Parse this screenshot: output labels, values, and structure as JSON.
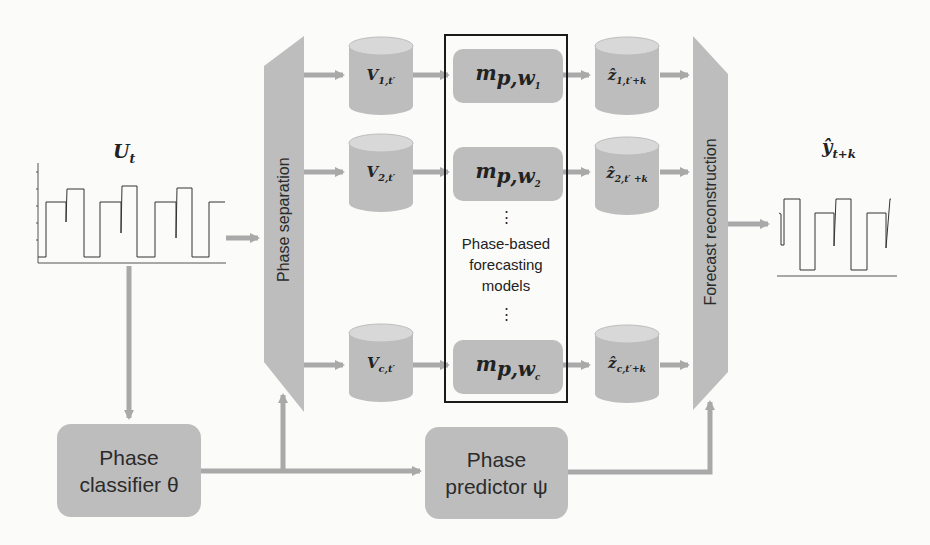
{
  "diagram": {
    "input_series": {
      "label": "U",
      "label_sub": "t"
    },
    "output_series": {
      "label": "ŷ",
      "label_sub": "t+k"
    },
    "phase_separation": {
      "label": "Phase separation"
    },
    "forecast_reconstruction": {
      "label": "Forecast reconstruction"
    },
    "phase_classifier": {
      "line1": "Phase",
      "line2": "classifier θ"
    },
    "phase_predictor": {
      "line1": "Phase",
      "line2": "predictor ψ"
    },
    "model_group": {
      "label_line1": "Phase-based",
      "label_line2": "forecasting",
      "label_line3": "models",
      "ellipsis": "⋮"
    },
    "inputs": [
      {
        "main": "V",
        "sub": "1,t′"
      },
      {
        "main": "V",
        "sub": "2,t′"
      },
      {
        "main": "V",
        "sub": "c,t′"
      }
    ],
    "models": [
      {
        "main": "m",
        "sub": "p,w",
        "subsub": "1"
      },
      {
        "main": "m",
        "sub": "p,w",
        "subsub": "2"
      },
      {
        "main": "m",
        "sub": "p,w",
        "subsub": "c"
      }
    ],
    "outputs": [
      {
        "main": "ẑ",
        "sub": "1,t′+k"
      },
      {
        "main": "ẑ",
        "sub": "2,t′ +k"
      },
      {
        "main": "ẑ",
        "sub": "c,t′+k"
      }
    ]
  },
  "colors": {
    "block_fill": "#bdbdbd",
    "arrow": "#a9a9a9",
    "frame": "#1a1a1a",
    "background": "#fbfbfa"
  }
}
